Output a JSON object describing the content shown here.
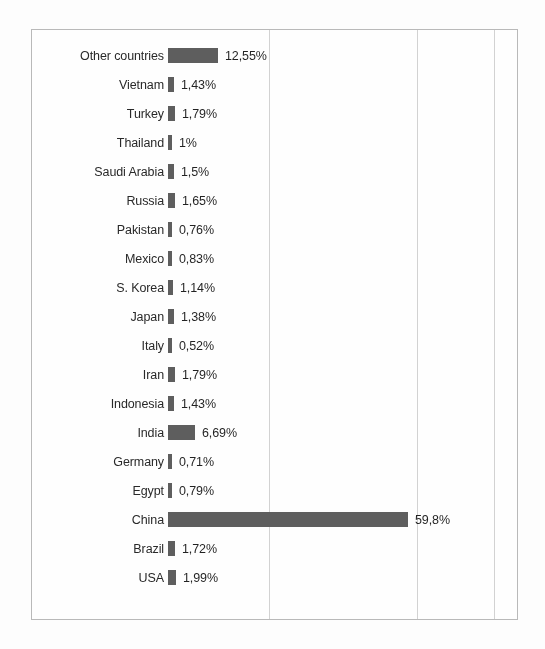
{
  "chart_data": {
    "type": "bar",
    "orientation": "horizontal",
    "title": "",
    "subtitle": "",
    "xlabel": "",
    "ylabel": "",
    "xlim": [
      0,
      110
    ],
    "grid": true,
    "gridlines_at": [
      25,
      62,
      81
    ],
    "legend": "none",
    "axis_tick_labels": [],
    "value_format": "comma-decimal-percent",
    "bar_color": "#5c5c5c",
    "categories": [
      "Other countries",
      "Vietnam",
      "Turkey",
      "Thailand",
      "Saudi Arabia",
      "Russia",
      "Pakistan",
      "Mexico",
      "S. Korea",
      "Japan",
      "Italy",
      "Iran",
      "Indonesia",
      "India",
      "Germany",
      "Egypt",
      "China",
      "Brazil",
      "USA"
    ],
    "values": [
      12.55,
      1.43,
      1.79,
      1.0,
      1.5,
      1.65,
      0.76,
      0.83,
      1.14,
      1.38,
      0.52,
      1.79,
      1.43,
      6.69,
      0.71,
      0.79,
      59.8,
      1.72,
      1.99
    ],
    "value_labels": [
      "12,55%",
      "1,43%",
      "1,79%",
      "1%",
      "1,5%",
      "1,65%",
      "0,76%",
      "0,83%",
      "1,14%",
      "1,38%",
      "0,52%",
      "1,79%",
      "1,43%",
      "6,69%",
      "0,71%",
      "0,79%",
      "59,8%",
      "1,72%",
      "1,99%"
    ]
  },
  "rows": [
    {
      "label": "Other countries",
      "value": 12.55,
      "value_label": "12,55%"
    },
    {
      "label": "Vietnam",
      "value": 1.43,
      "value_label": "1,43%"
    },
    {
      "label": "Turkey",
      "value": 1.79,
      "value_label": "1,79%"
    },
    {
      "label": "Thailand",
      "value": 1.0,
      "value_label": "1%"
    },
    {
      "label": "Saudi Arabia",
      "value": 1.5,
      "value_label": "1,5%"
    },
    {
      "label": "Russia",
      "value": 1.65,
      "value_label": "1,65%"
    },
    {
      "label": "Pakistan",
      "value": 0.76,
      "value_label": "0,76%"
    },
    {
      "label": "Mexico",
      "value": 0.83,
      "value_label": "0,83%"
    },
    {
      "label": "S. Korea",
      "value": 1.14,
      "value_label": "1,14%"
    },
    {
      "label": "Japan",
      "value": 1.38,
      "value_label": "1,38%"
    },
    {
      "label": "Italy",
      "value": 0.52,
      "value_label": "0,52%"
    },
    {
      "label": "Iran",
      "value": 1.79,
      "value_label": "1,79%"
    },
    {
      "label": "Indonesia",
      "value": 1.43,
      "value_label": "1,43%"
    },
    {
      "label": "India",
      "value": 6.69,
      "value_label": "6,69%"
    },
    {
      "label": "Germany",
      "value": 0.71,
      "value_label": "0,71%"
    },
    {
      "label": "Egypt",
      "value": 0.79,
      "value_label": "0,79%"
    },
    {
      "label": "China",
      "value": 59.8,
      "value_label": "59,8%"
    },
    {
      "label": "Brazil",
      "value": 1.72,
      "value_label": "1,72%"
    },
    {
      "label": "USA",
      "value": 1.99,
      "value_label": "1,99%"
    }
  ],
  "style": {
    "bar_color": "#5c5c5c",
    "gridline_color": "#d2d2d2",
    "frame_color": "#b9b9b9",
    "text_color": "#262626",
    "background": "#ffffff"
  },
  "scale": {
    "px_per_percent": 4.02,
    "bar_origin_px": 136
  }
}
